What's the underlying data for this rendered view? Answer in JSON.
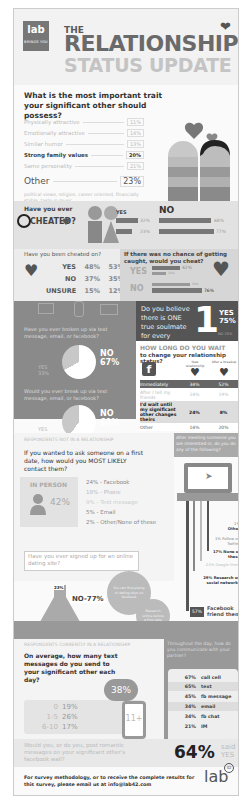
{
  "header": {
    "logo": {
      "main": "lab",
      "sub": "BRINGS YOU"
    },
    "title_line1": "THE",
    "title_line2": "RELATIONSHIP",
    "title_line3": "STATUS UPDATE"
  },
  "trait": {
    "question": "What is the most important trait your significant other should possess?",
    "items": [
      {
        "label": "Physically attractive",
        "pct": "11%"
      },
      {
        "label": "Emotionally attractive",
        "pct": "14%"
      },
      {
        "label": "Similar humor",
        "pct": "13%"
      },
      {
        "label": "Strong family values",
        "pct": "20%"
      },
      {
        "label": "Same personality",
        "pct": "21%"
      },
      {
        "label": "Other",
        "pct": "23%"
      }
    ],
    "other_note": "political views, religion, career oriented, financially stable, taste in music"
  },
  "cheated": {
    "title_line1": "Have you ever",
    "title_line2": "CHEATED?",
    "yes_label": "YES",
    "no_label": "NO",
    "rows": [
      {
        "yes": "32%",
        "no": "68%"
      },
      {
        "yes": "23%",
        "no": "77%"
      }
    ]
  },
  "cheated_on": {
    "question": "Have you been cheated on?",
    "rows": [
      {
        "label": "YES",
        "a": "48%",
        "b": "53%"
      },
      {
        "label": "NO",
        "a": "37%",
        "b": "35%"
      },
      {
        "label": "UNSURE",
        "a": "15%",
        "b": "12%"
      }
    ]
  },
  "would_cheat": {
    "question": "If there was no chance of getting caught, would you cheat?",
    "yes_label": "YES",
    "no_label": "NO",
    "yes_values": [
      "42%",
      "24%"
    ],
    "no_values": [
      "58%",
      "76%"
    ]
  },
  "broken_up": {
    "q1": "Have you ever broken up via text message, email, or facebook?",
    "q1_no": "NO",
    "q1_no_pct": "67%",
    "q1_yes": "YES",
    "q1_yes_pct": "33%",
    "q2": "Would you ever break up via text message, email, or facebook?",
    "q2_no": "NO",
    "q2_no_pct": "60%",
    "q2_yes": "YES",
    "q2_yes_pct": "40%"
  },
  "soulmate": {
    "question": "Do you believe there is ONE true soulmate for every person?",
    "number": "1",
    "yes": "YES",
    "yes_pct": "75%",
    "no_note": "NO 25%"
  },
  "wait": {
    "title1": "HOW LONG DO YOU WAIT",
    "title2": "to change your relationship status?",
    "fb_icon": "f",
    "col1": "New relationship",
    "col2": "After a breakup",
    "rows": [
      {
        "label": "Immediately",
        "a": "34%",
        "b": "52%"
      },
      {
        "label": "After I tell my friends",
        "a": "24%",
        "b": "19%"
      },
      {
        "label": "I'd wait until my significant other changes theirs",
        "a": "24%",
        "b": "8%"
      },
      {
        "label": "Other",
        "a": "14%",
        "b": "20%"
      }
    ]
  },
  "not_in_relationship": {
    "section_label": "RESPONDENTS NOT IN A RELATIONSHIP",
    "question": "If you wanted to ask someone on a first date, how would you MOST LIKELY contact them?",
    "in_person": "IN PERSON",
    "in_person_pct": "42%",
    "items": [
      "24% - Facebook",
      "18% - Phone",
      "9% - Text message",
      "5% - Email",
      "2% - Other/None of these"
    ],
    "dating_q": "Have you ever signed up for an online dating site?",
    "dating_yes": "23%",
    "dating_no": "NO-77%",
    "bubble1": "You can find plenty of dating sites on facebook",
    "bubble2": "Research online before a first date"
  },
  "after_meeting": {
    "question": "After meeting someone you are interested in, do you do any of the following?",
    "items": [
      {
        "pct": "1%",
        "label": "Other"
      },
      {
        "pct": "1%",
        "label": "Follow on Twitter"
      },
      {
        "pct": "17%",
        "label": "None of these"
      },
      {
        "pct": "24%",
        "label": "Google them"
      },
      {
        "pct": "29%",
        "label": "Research on social networks"
      }
    ],
    "top_pct": "57%",
    "top_label": "Facebook friend them"
  },
  "in_relationship": {
    "section_label": "RESPONDENTS CURRENTLY IN A RELATIONSHIP",
    "question": "On average, how many text messages do you send to your significant other each day?",
    "rows": [
      {
        "range": "0",
        "pct": "19%"
      },
      {
        "range": "1-5",
        "pct": "26%"
      },
      {
        "range": "6-10",
        "pct": "17%"
      }
    ],
    "top_pct": "38%",
    "top_range": "11+"
  },
  "communicate": {
    "question": "Throughout the day, how do you communicate with your partner?",
    "items": [
      {
        "pct": "67%",
        "label": "call cell"
      },
      {
        "pct": "65%",
        "label": "text"
      },
      {
        "pct": "45%",
        "label": "fb message"
      },
      {
        "pct": "34%",
        "label": "email"
      },
      {
        "pct": "34%",
        "label": "fb chat"
      },
      {
        "pct": "21%",
        "label": "IM"
      }
    ]
  },
  "romantic": {
    "question": "Would you, or do you, post romantic messages on your significant other's facebook wall?",
    "pct": "64%",
    "said": "said",
    "yes": "YES"
  },
  "footer": {
    "text": "For survey methodology, or to receive the complete results for this survey, please email us at info@lab42.com",
    "logo": "lab",
    "logo_num": "42"
  }
}
